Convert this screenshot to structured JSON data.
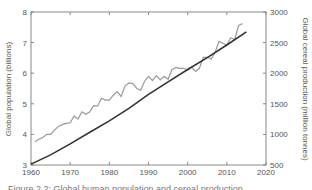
{
  "chart_data": {
    "type": "line",
    "title": "",
    "xlabel": "",
    "ylabel": "Global population (billions)",
    "y2label": "Global cereal production (million tonnes)",
    "xlim": [
      1960,
      2020
    ],
    "ylim": [
      3,
      8
    ],
    "y2lim": [
      500,
      3000
    ],
    "x_ticks": [
      1960,
      1970,
      1980,
      1990,
      2000,
      2010,
      2020
    ],
    "y_ticks": [
      3,
      4,
      5,
      6,
      7,
      8
    ],
    "y2_ticks": [
      500,
      1000,
      1500,
      2000,
      2500,
      3000
    ],
    "grid": false,
    "legend": null,
    "series": [
      {
        "name": "Global population",
        "axis": "left",
        "color": "#333333",
        "x": [
          1960,
          1965,
          1970,
          1975,
          1980,
          1985,
          1990,
          1995,
          2000,
          2005,
          2010,
          2015
        ],
        "values": [
          3.03,
          3.33,
          3.69,
          4.07,
          4.44,
          4.85,
          5.31,
          5.72,
          6.12,
          6.51,
          6.92,
          7.35
        ]
      },
      {
        "name": "Global cereal production",
        "axis": "right",
        "color": "#999999",
        "x": [
          1961,
          1962,
          1963,
          1964,
          1965,
          1966,
          1967,
          1968,
          1969,
          1970,
          1971,
          1972,
          1973,
          1974,
          1975,
          1976,
          1977,
          1978,
          1979,
          1980,
          1981,
          1982,
          1983,
          1984,
          1985,
          1986,
          1987,
          1988,
          1989,
          1990,
          1991,
          1992,
          1993,
          1994,
          1995,
          1996,
          1997,
          1998,
          1999,
          2000,
          2001,
          2002,
          2003,
          2004,
          2005,
          2006,
          2007,
          2008,
          2009,
          2010,
          2011,
          2012,
          2013,
          2014
        ],
        "values": [
          880,
          920,
          950,
          1000,
          1000,
          1070,
          1130,
          1160,
          1180,
          1190,
          1300,
          1250,
          1370,
          1330,
          1370,
          1470,
          1460,
          1590,
          1560,
          1560,
          1640,
          1700,
          1620,
          1790,
          1840,
          1830,
          1750,
          1720,
          1870,
          1950,
          1880,
          1960,
          1890,
          1950,
          1900,
          2060,
          2090,
          2080,
          2080,
          2050,
          2100,
          2030,
          2080,
          2260,
          2260,
          2230,
          2340,
          2520,
          2490,
          2460,
          2580,
          2550,
          2780,
          2810
        ]
      }
    ]
  },
  "caption": "Figure 2.2: Global human population and cereal production"
}
